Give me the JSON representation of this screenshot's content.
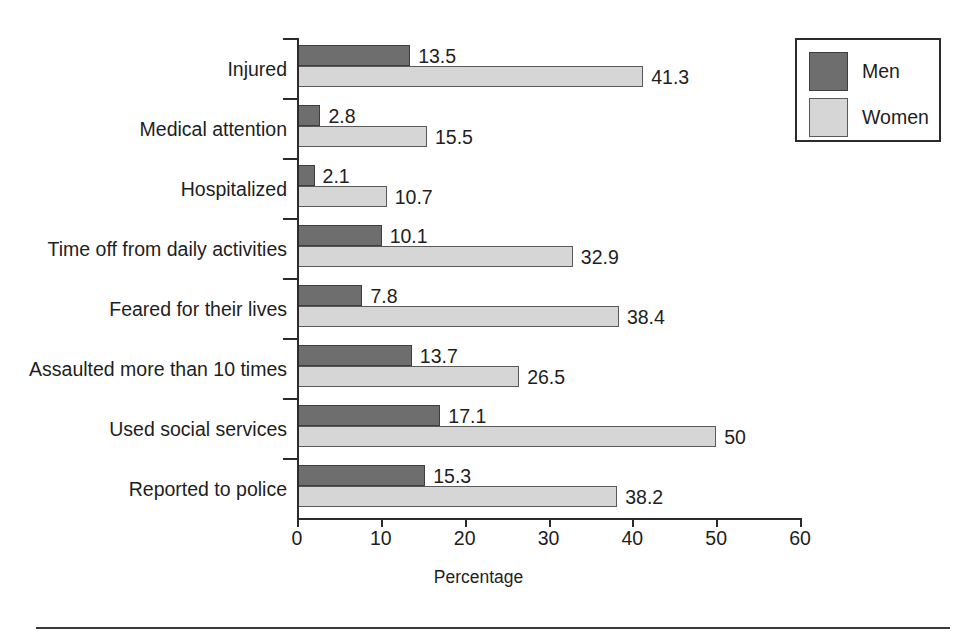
{
  "chart_data": {
    "type": "bar",
    "orientation": "horizontal",
    "title": "",
    "xlabel": "Percentage",
    "ylabel": "",
    "xlim": [
      0,
      60
    ],
    "xticks": [
      0,
      10,
      20,
      30,
      40,
      50,
      60
    ],
    "grid": false,
    "legend_position": "top-right",
    "categories": [
      "Injured",
      "Medical attention",
      "Hospitalized",
      "Time off from daily activities",
      "Feared for their lives",
      "Assaulted more than 10 times",
      "Used social services",
      "Reported to police"
    ],
    "series": [
      {
        "name": "Men",
        "color": "#6e6e6e",
        "values": [
          13.5,
          2.8,
          2.1,
          10.1,
          7.8,
          13.7,
          17.1,
          15.3
        ],
        "labels": [
          "13.5",
          "2.8",
          "2.1",
          "10.1",
          "7.8",
          "13.7",
          "17.1",
          "15.3"
        ]
      },
      {
        "name": "Women",
        "color": "#d6d6d6",
        "values": [
          41.3,
          15.5,
          10.7,
          32.9,
          38.4,
          26.5,
          50,
          38.2
        ],
        "labels": [
          "41.3",
          "15.5",
          "10.7",
          "32.9",
          "38.4",
          "26.5",
          "50",
          "38.2"
        ]
      }
    ]
  },
  "legend": {
    "entries": [
      {
        "label": "Men",
        "swatch": "men"
      },
      {
        "label": "Women",
        "swatch": "women"
      }
    ]
  }
}
